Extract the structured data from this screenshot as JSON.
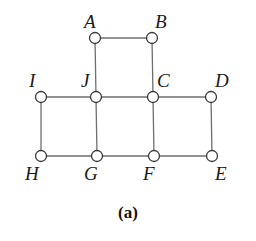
{
  "figure": {
    "caption": "(a)",
    "edge_color": "#6f6f6f",
    "node_stroke_color": "#3a3a3a",
    "node_fill_color": "#ffffff",
    "label_color": "#1a1a1a",
    "background_color": "#ffffff",
    "node_radius": 5.5,
    "edge_width": 1.3,
    "node_stroke_width": 1.3
  },
  "graph": {
    "nodes": [
      {
        "id": "A",
        "label": "A",
        "x": 95,
        "y": 38,
        "label_x": 84,
        "label_y": 12
      },
      {
        "id": "B",
        "label": "B",
        "x": 152,
        "y": 38,
        "label_x": 155,
        "label_y": 12
      },
      {
        "id": "I",
        "label": "I",
        "x": 41,
        "y": 97,
        "label_x": 29,
        "label_y": 71
      },
      {
        "id": "J",
        "label": "J",
        "x": 96,
        "y": 97,
        "label_x": 81,
        "label_y": 71
      },
      {
        "id": "C",
        "label": "C",
        "x": 153,
        "y": 97,
        "label_x": 157,
        "label_y": 71
      },
      {
        "id": "D",
        "label": "D",
        "x": 211,
        "y": 97,
        "label_x": 215,
        "label_y": 71
      },
      {
        "id": "H",
        "label": "H",
        "x": 41,
        "y": 156,
        "label_x": 25,
        "label_y": 164
      },
      {
        "id": "G",
        "label": "G",
        "x": 97,
        "y": 156,
        "label_x": 84,
        "label_y": 164
      },
      {
        "id": "F",
        "label": "F",
        "x": 154,
        "y": 156,
        "label_x": 143,
        "label_y": 164
      },
      {
        "id": "E",
        "label": "E",
        "x": 212,
        "y": 156,
        "label_x": 215,
        "label_y": 164
      }
    ],
    "edges": [
      {
        "from": "A",
        "to": "B"
      },
      {
        "from": "A",
        "to": "J"
      },
      {
        "from": "B",
        "to": "C"
      },
      {
        "from": "I",
        "to": "J"
      },
      {
        "from": "J",
        "to": "C"
      },
      {
        "from": "C",
        "to": "D"
      },
      {
        "from": "I",
        "to": "H"
      },
      {
        "from": "J",
        "to": "G"
      },
      {
        "from": "C",
        "to": "F"
      },
      {
        "from": "D",
        "to": "E"
      },
      {
        "from": "H",
        "to": "G"
      },
      {
        "from": "G",
        "to": "F"
      },
      {
        "from": "F",
        "to": "E"
      }
    ]
  },
  "chart_data": {
    "type": "diagram",
    "title": "(a)",
    "subtype": "undirected-graph",
    "node_count": 10,
    "edge_count": 13,
    "node_ids": [
      "A",
      "B",
      "C",
      "D",
      "E",
      "F",
      "G",
      "H",
      "I",
      "J"
    ],
    "edge_list": [
      [
        "A",
        "B"
      ],
      [
        "A",
        "J"
      ],
      [
        "B",
        "C"
      ],
      [
        "I",
        "J"
      ],
      [
        "J",
        "C"
      ],
      [
        "C",
        "D"
      ],
      [
        "I",
        "H"
      ],
      [
        "J",
        "G"
      ],
      [
        "C",
        "F"
      ],
      [
        "D",
        "E"
      ],
      [
        "H",
        "G"
      ],
      [
        "G",
        "F"
      ],
      [
        "F",
        "E"
      ]
    ],
    "degrees": {
      "A": 2,
      "B": 2,
      "C": 4,
      "D": 2,
      "E": 2,
      "F": 3,
      "G": 3,
      "H": 2,
      "I": 2,
      "J": 4
    }
  }
}
